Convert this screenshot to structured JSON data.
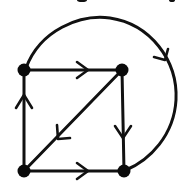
{
  "diagram": {
    "type": "directed-graph",
    "colors": {
      "stroke": "#111111",
      "node": "#0a0a0a",
      "background": "#ffffff"
    },
    "nodes": [
      {
        "id": "A",
        "position": "top-left",
        "x": 24,
        "y": 70
      },
      {
        "id": "B",
        "position": "top-right",
        "x": 122,
        "y": 70
      },
      {
        "id": "C",
        "position": "bottom-left",
        "x": 24,
        "y": 171
      },
      {
        "id": "D",
        "position": "bottom-right",
        "x": 124,
        "y": 171
      }
    ],
    "edges": [
      {
        "from": "A",
        "to": "B",
        "shape": "straight",
        "arrow_direction": "right"
      },
      {
        "from": "B",
        "to": "D",
        "shape": "straight",
        "arrow_direction": "down"
      },
      {
        "from": "C",
        "to": "D",
        "shape": "straight",
        "arrow_direction": "right"
      },
      {
        "from": "C",
        "to": "A",
        "shape": "straight",
        "arrow_direction": "up"
      },
      {
        "from": "B",
        "to": "C",
        "shape": "diagonal",
        "arrow_direction": "down-left"
      },
      {
        "from": "A",
        "to": "D",
        "shape": "outer-arc",
        "arrow_direction": "clockwise"
      }
    ],
    "node_count": 4,
    "edge_count": 6
  }
}
